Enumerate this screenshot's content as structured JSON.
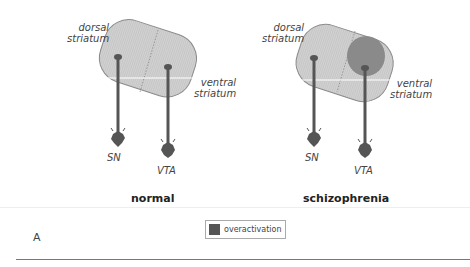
{
  "panels": [
    {
      "id": "normal",
      "caption": "normal",
      "labels": {
        "dorsal": "dorsal\nstriatum",
        "dorsal_line1": "dorsal",
        "dorsal_line2": "striatum",
        "ventral_line1": "ventral",
        "ventral_line2": "striatum",
        "sn": "SN",
        "vta": "VTA"
      },
      "overactivation": false
    },
    {
      "id": "schizophrenia",
      "caption": "schizophrenia",
      "labels": {
        "dorsal_line1": "dorsal",
        "dorsal_line2": "striatum",
        "ventral_line1": "ventral",
        "ventral_line2": "striatum",
        "sn": "SN",
        "vta": "VTA"
      },
      "overactivation": true
    }
  ],
  "legend": {
    "swatch_color": "#555555",
    "label": "overactivation"
  },
  "figure_letter": "A",
  "colors": {
    "striatum_fill": "#cfcfcf",
    "striatum_stroke": "#8a8a8a",
    "neuron": "#555555",
    "overactivation": "#8a8a8a"
  }
}
